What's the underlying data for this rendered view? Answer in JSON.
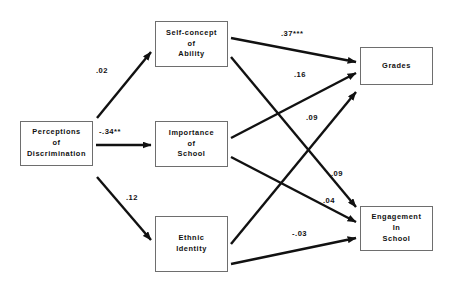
{
  "figure": {
    "type": "path-diagram",
    "title": ""
  },
  "nodes": [
    {
      "id": "perceptions-of-discrimination",
      "label_lines": [
        "Perceptions",
        "of",
        "Discrimination"
      ],
      "x": 20,
      "y": 121,
      "w": 73,
      "h": 45
    },
    {
      "id": "self-concept-of-ability",
      "label_lines": [
        "Self-concept",
        "of",
        "Ability"
      ],
      "x": 155,
      "y": 21,
      "w": 73,
      "h": 46
    },
    {
      "id": "importance-of-school",
      "label_lines": [
        "Importance",
        "of",
        "School"
      ],
      "x": 155,
      "y": 121,
      "w": 73,
      "h": 46
    },
    {
      "id": "ethnic-identity",
      "label_lines": [
        "Ethnic",
        "Identity"
      ],
      "x": 155,
      "y": 216,
      "w": 73,
      "h": 56
    },
    {
      "id": "grades",
      "label_lines": [
        "Grades"
      ],
      "x": 360,
      "y": 47,
      "w": 73,
      "h": 38
    },
    {
      "id": "engagement-in-school",
      "label_lines": [
        "Engagement",
        "In",
        "School"
      ],
      "x": 360,
      "y": 206,
      "w": 73,
      "h": 45
    }
  ],
  "edges": [
    {
      "id": "disc-to-selfconcept",
      "from": "perceptions-of-discrimination",
      "to": "self-concept-of-ability",
      "coefficient": ".02",
      "label_x": 96,
      "label_y": 66,
      "x1": 97,
      "y1": 118,
      "x2": 151,
      "y2": 52
    },
    {
      "id": "disc-to-importance",
      "from": "perceptions-of-discrimination",
      "to": "importance-of-school",
      "coefficient": "-.34**",
      "label_x": 99,
      "label_y": 127,
      "x1": 96,
      "y1": 145,
      "x2": 151,
      "y2": 145
    },
    {
      "id": "disc-to-ethnic",
      "from": "perceptions-of-discrimination",
      "to": "ethnic-identity",
      "coefficient": ".12",
      "label_x": 126,
      "label_y": 193,
      "x1": 97,
      "y1": 177,
      "x2": 151,
      "y2": 240
    },
    {
      "id": "selfconcept-to-grades",
      "from": "self-concept-of-ability",
      "to": "grades",
      "coefficient": ".37***",
      "label_x": 281,
      "label_y": 29,
      "x1": 231,
      "y1": 38,
      "x2": 356,
      "y2": 62
    },
    {
      "id": "selfconcept-to-engagement",
      "from": "self-concept-of-ability",
      "to": "engagement-in-school",
      "coefficient": ".09",
      "label_x": 331,
      "label_y": 169,
      "x1": 231,
      "y1": 57,
      "x2": 356,
      "y2": 207
    },
    {
      "id": "importance-to-grades",
      "from": "importance-of-school",
      "to": "grades",
      "coefficient": ".16",
      "label_x": 294,
      "label_y": 70,
      "x1": 231,
      "y1": 138,
      "x2": 356,
      "y2": 73
    },
    {
      "id": "importance-to-engagement",
      "from": "importance-of-school",
      "to": "engagement-in-school",
      "coefficient": ".04",
      "label_x": 323,
      "label_y": 196,
      "x1": 231,
      "y1": 157,
      "x2": 356,
      "y2": 222
    },
    {
      "id": "ethnic-to-grades",
      "from": "ethnic-identity",
      "to": "grades",
      "coefficient": ".09",
      "label_x": 306,
      "label_y": 113,
      "x1": 231,
      "y1": 244,
      "x2": 356,
      "y2": 92
    },
    {
      "id": "ethnic-to-engagement",
      "from": "ethnic-identity",
      "to": "engagement-in-school",
      "coefficient": "-.03",
      "label_x": 292,
      "label_y": 229,
      "x1": 231,
      "y1": 264,
      "x2": 356,
      "y2": 238
    }
  ],
  "style": {
    "line_color": "#111111",
    "box_border_color": "#6e6e6e",
    "background": "#ffffff"
  }
}
